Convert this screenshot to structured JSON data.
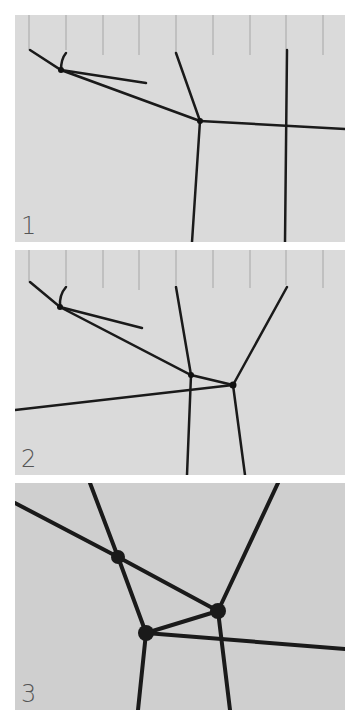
{
  "panels": [
    {
      "label": "1",
      "description": "Cords hanging from pins on a board; first cords joined"
    },
    {
      "label": "2",
      "description": "Additional cord added and second knot joined"
    },
    {
      "label": "3",
      "description": "Close-up of knots joining cords"
    }
  ],
  "colors": {
    "background": "#ffffff",
    "board": "#dadada",
    "cord": "#1a1a1a",
    "label": "#555555"
  }
}
